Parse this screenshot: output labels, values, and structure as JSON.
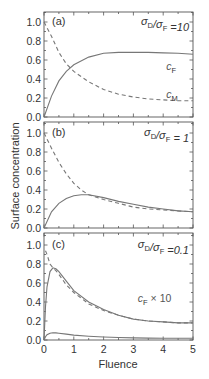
{
  "chart_data": [
    {
      "type": "line",
      "panel": "(a)",
      "annotation": "σD/σF =10",
      "xlabel": "Fluence",
      "ylabel": "Surface concentration",
      "xlim": [
        0,
        5
      ],
      "ylim": [
        0,
        1.1
      ],
      "x_ticks": [
        0,
        1,
        2,
        3,
        4,
        5
      ],
      "y_ticks": [
        "0.0",
        "0.2",
        "0.4",
        "0.6",
        "0.8",
        "1.0"
      ],
      "grid": false,
      "series": [
        {
          "name": "cF",
          "style": "solid",
          "x": [
            0,
            0.25,
            0.5,
            0.75,
            1.0,
            1.5,
            2.0,
            2.5,
            3.0,
            3.5,
            4.0,
            4.5,
            5.0
          ],
          "y": [
            0.0,
            0.22,
            0.38,
            0.48,
            0.55,
            0.63,
            0.67,
            0.68,
            0.68,
            0.68,
            0.675,
            0.67,
            0.66
          ]
        },
        {
          "name": "cM",
          "style": "dashed",
          "x": [
            0,
            0.25,
            0.5,
            0.75,
            1.0,
            1.5,
            2.0,
            2.5,
            3.0,
            3.5,
            4.0,
            4.5,
            5.0
          ],
          "y": [
            1.0,
            0.85,
            0.68,
            0.56,
            0.48,
            0.37,
            0.29,
            0.24,
            0.21,
            0.19,
            0.18,
            0.17,
            0.17
          ]
        }
      ],
      "labels": [
        {
          "text": "c",
          "sub": "F",
          "x": 4.1,
          "y": 0.5
        },
        {
          "text": "c",
          "sub": "M",
          "x": 4.1,
          "y": 0.2
        }
      ]
    },
    {
      "type": "line",
      "panel": "(b)",
      "annotation": "σD/σF = 1",
      "xlim": [
        0,
        5
      ],
      "ylim": [
        0,
        1.1
      ],
      "series": [
        {
          "name": "cF",
          "style": "solid",
          "x": [
            0,
            0.25,
            0.5,
            0.75,
            1.0,
            1.25,
            1.5,
            2.0,
            2.5,
            3.0,
            3.5,
            4.0,
            4.5,
            5.0
          ],
          "y": [
            0.0,
            0.17,
            0.26,
            0.31,
            0.34,
            0.35,
            0.35,
            0.32,
            0.28,
            0.25,
            0.22,
            0.2,
            0.18,
            0.17
          ]
        },
        {
          "name": "cM",
          "style": "dashed",
          "x": [
            0,
            0.25,
            0.5,
            0.75,
            1.0,
            1.25,
            1.5,
            2.0,
            2.5,
            3.0,
            3.5,
            4.0,
            4.5,
            5.0
          ],
          "y": [
            1.0,
            0.84,
            0.69,
            0.57,
            0.47,
            0.4,
            0.35,
            0.3,
            0.26,
            0.22,
            0.2,
            0.19,
            0.18,
            0.17
          ]
        }
      ]
    },
    {
      "type": "line",
      "panel": "(c)",
      "annotation": "σD/σF =0.1",
      "xlim": [
        0,
        5
      ],
      "ylim": [
        0,
        1.1
      ],
      "series": [
        {
          "name": "cF × 10",
          "style": "solid",
          "x": [
            0,
            0.05,
            0.1,
            0.2,
            0.3,
            0.4,
            0.5,
            0.75,
            1.0,
            1.5,
            2.0,
            2.5,
            3.0,
            3.5,
            4.0,
            4.5,
            5.0
          ],
          "y": [
            0.0,
            0.35,
            0.56,
            0.72,
            0.76,
            0.75,
            0.72,
            0.62,
            0.52,
            0.4,
            0.32,
            0.26,
            0.22,
            0.2,
            0.19,
            0.18,
            0.18
          ]
        },
        {
          "name": "cM",
          "style": "dashed",
          "x": [
            0.05,
            0.1,
            0.2,
            0.3,
            0.4,
            0.5,
            0.75,
            1.0,
            1.5,
            2.0,
            2.5,
            3.0,
            3.5,
            4.0,
            4.5,
            5.0
          ],
          "y": [
            0.94,
            0.9,
            0.8,
            0.76,
            0.73,
            0.69,
            0.58,
            0.5,
            0.38,
            0.31,
            0.26,
            0.22,
            0.2,
            0.19,
            0.18,
            0.18
          ]
        },
        {
          "name": "cF",
          "style": "solid",
          "x": [
            0,
            0.05,
            0.1,
            0.2,
            0.3,
            0.4,
            0.5,
            0.75,
            1.0,
            1.5,
            2.0,
            2.5,
            3.0,
            3.5,
            4.0,
            4.5,
            5.0
          ],
          "y": [
            0.0,
            0.035,
            0.056,
            0.072,
            0.076,
            0.075,
            0.072,
            0.062,
            0.052,
            0.04,
            0.032,
            0.026,
            0.022,
            0.02,
            0.019,
            0.018,
            0.018
          ]
        }
      ],
      "labels": [
        {
          "text": "c",
          "sub": "F",
          "suffix": " × 10",
          "x": 3.15,
          "y": 0.4
        }
      ]
    }
  ],
  "figure": {
    "xlabel": "Fluence",
    "ylabel": "Surface concentration",
    "x_tick_labels": [
      "0",
      "1",
      "2",
      "3",
      "4",
      "5"
    ],
    "y_tick_labels": [
      "0.0",
      "0.2",
      "0.4",
      "0.6",
      "0.8",
      "1.0"
    ],
    "panel_labels": [
      "(a)",
      "(b)",
      "(c)"
    ],
    "annotations": [
      {
        "sym1": "σ",
        "sub1": "D",
        "slash": "/",
        "sym2": "σ",
        "sub2": "F",
        "rest": " =10"
      },
      {
        "sym1": "σ",
        "sub1": "D",
        "slash": "/",
        "sym2": "σ",
        "sub2": "F",
        "rest": " = 1"
      },
      {
        "sym1": "σ",
        "sub1": "D",
        "slash": "/",
        "sym2": "σ",
        "sub2": "F",
        "rest": " =0.1"
      }
    ]
  }
}
